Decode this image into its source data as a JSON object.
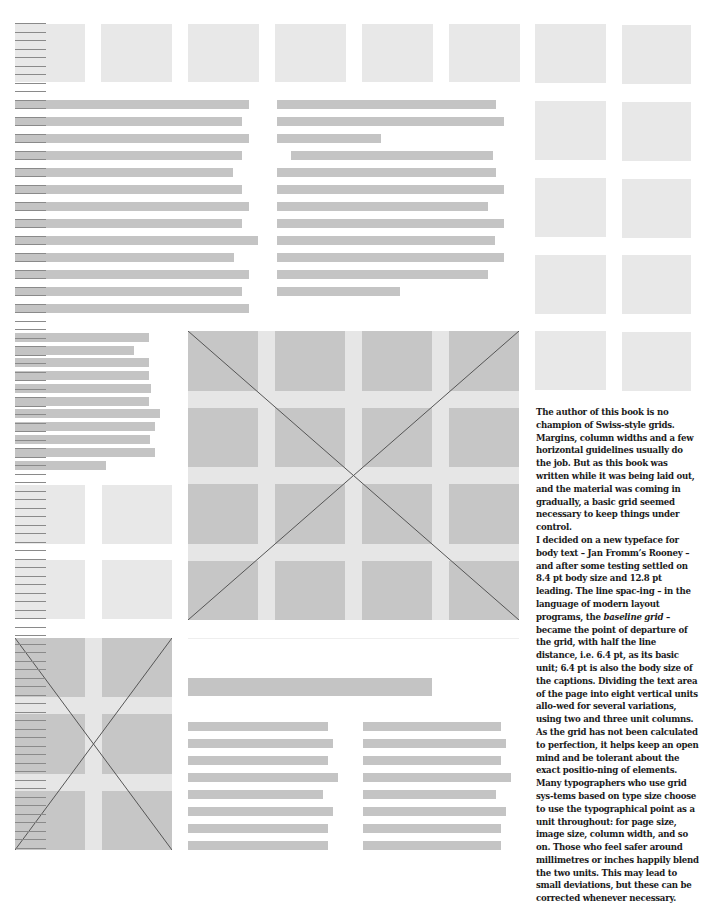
{
  "page": {
    "background": "#ffffff",
    "colors": {
      "placeholder_light": "#e8e8e8",
      "text_bar": "#c4c4c4",
      "image_cell": "#c6c6c6",
      "image_gutter": "#e6e6e6",
      "baseline_rule": "#8a8a8a",
      "cross_line": "#555555",
      "caption_text": "#1a1a1a"
    }
  },
  "baseline_ruler": {
    "x": 15,
    "width": 31,
    "start_y": 23,
    "step": 8.5,
    "end_y": 850
  },
  "top_row_squares": [
    {
      "x": 15,
      "y": 24,
      "w": 70,
      "h": 58
    },
    {
      "x": 101,
      "y": 24,
      "w": 71,
      "h": 58
    },
    {
      "x": 188,
      "y": 24,
      "w": 71,
      "h": 58
    },
    {
      "x": 275,
      "y": 24,
      "w": 71,
      "h": 58
    },
    {
      "x": 362,
      "y": 24,
      "w": 71,
      "h": 58
    },
    {
      "x": 449,
      "y": 24,
      "w": 71,
      "h": 58
    }
  ],
  "right_column_squares": [
    {
      "x": 535,
      "y": 24,
      "w": 71,
      "h": 59
    },
    {
      "x": 622,
      "y": 25,
      "w": 69,
      "h": 59
    },
    {
      "x": 535,
      "y": 101,
      "w": 71,
      "h": 59
    },
    {
      "x": 622,
      "y": 102,
      "w": 69,
      "h": 59
    },
    {
      "x": 535,
      "y": 178,
      "w": 71,
      "h": 59
    },
    {
      "x": 622,
      "y": 179,
      "w": 69,
      "h": 59
    },
    {
      "x": 535,
      "y": 255,
      "w": 71,
      "h": 59
    },
    {
      "x": 622,
      "y": 255,
      "w": 69,
      "h": 59
    },
    {
      "x": 535,
      "y": 331,
      "w": 71,
      "h": 59
    },
    {
      "x": 622,
      "y": 332,
      "w": 69,
      "h": 59
    }
  ],
  "text_block_left_top": {
    "x": 15,
    "lines": [
      {
        "y": 100,
        "w": 234
      },
      {
        "y": 117,
        "w": 227
      },
      {
        "y": 134,
        "w": 234
      },
      {
        "y": 151,
        "w": 227
      },
      {
        "y": 168,
        "w": 218
      },
      {
        "y": 185,
        "w": 227
      },
      {
        "y": 202,
        "w": 234
      },
      {
        "y": 219,
        "w": 227
      },
      {
        "y": 236,
        "w": 243
      },
      {
        "y": 253,
        "w": 219
      },
      {
        "y": 270,
        "w": 234
      },
      {
        "y": 287,
        "w": 227
      },
      {
        "y": 304,
        "w": 234
      }
    ]
  },
  "text_block_right_top": {
    "lines": [
      {
        "x": 277,
        "y": 100,
        "w": 219
      },
      {
        "x": 277,
        "y": 117,
        "w": 227
      },
      {
        "x": 277,
        "y": 134,
        "w": 104
      },
      {
        "x": 291,
        "y": 151,
        "w": 202
      },
      {
        "x": 277,
        "y": 168,
        "w": 219
      },
      {
        "x": 277,
        "y": 185,
        "w": 227
      },
      {
        "x": 277,
        "y": 202,
        "w": 211
      },
      {
        "x": 277,
        "y": 219,
        "w": 227
      },
      {
        "x": 277,
        "y": 236,
        "w": 218
      },
      {
        "x": 277,
        "y": 253,
        "w": 227
      },
      {
        "x": 277,
        "y": 270,
        "w": 211
      },
      {
        "x": 277,
        "y": 287,
        "w": 123
      }
    ]
  },
  "text_block_left_mid": {
    "x": 15,
    "lines": [
      {
        "y": 333,
        "w": 134
      },
      {
        "y": 346,
        "w": 119
      },
      {
        "y": 358,
        "w": 134
      },
      {
        "y": 371,
        "w": 134
      },
      {
        "y": 384,
        "w": 136
      },
      {
        "y": 397,
        "w": 134
      },
      {
        "y": 409,
        "w": 145
      },
      {
        "y": 422,
        "w": 140
      },
      {
        "y": 435,
        "w": 135
      },
      {
        "y": 448,
        "w": 140
      },
      {
        "y": 461,
        "w": 91
      }
    ]
  },
  "mid_left_squares": [
    {
      "x": 15,
      "y": 485,
      "w": 70,
      "h": 59
    },
    {
      "x": 102,
      "y": 485,
      "w": 70,
      "h": 59
    },
    {
      "x": 15,
      "y": 560,
      "w": 70,
      "h": 59
    },
    {
      "x": 102,
      "y": 560,
      "w": 70,
      "h": 59
    }
  ],
  "large_image_placeholder": {
    "x": 188,
    "y": 331,
    "w": 331,
    "h": 289,
    "cols": 4,
    "rows": 4,
    "gutter": 17,
    "crossed": true
  },
  "small_image_placeholder": {
    "x": 15,
    "y": 638,
    "w": 157,
    "h": 212,
    "cols": 2,
    "rows": 3,
    "gutter": 17,
    "crossed": true
  },
  "hairline_divider": {
    "x": 188,
    "y": 638,
    "w": 331
  },
  "bottom_heading_bar": {
    "x": 188,
    "y": 678,
    "w": 244,
    "h": 18
  },
  "bottom_text_columns": [
    {
      "x": 188,
      "lines": [
        {
          "y": 722,
          "w": 140
        },
        {
          "y": 739,
          "w": 145
        },
        {
          "y": 756,
          "w": 140
        },
        {
          "y": 773,
          "w": 150
        },
        {
          "y": 790,
          "w": 135
        },
        {
          "y": 807,
          "w": 145
        },
        {
          "y": 824,
          "w": 140
        },
        {
          "y": 841,
          "w": 140
        }
      ]
    },
    {
      "x": 363,
      "lines": [
        {
          "y": 722,
          "w": 138
        },
        {
          "y": 739,
          "w": 143
        },
        {
          "y": 756,
          "w": 138
        },
        {
          "y": 773,
          "w": 148
        },
        {
          "y": 790,
          "w": 133
        },
        {
          "y": 807,
          "w": 143
        },
        {
          "y": 824,
          "w": 138
        },
        {
          "y": 841,
          "w": 138
        }
      ]
    }
  ],
  "caption": {
    "paragraphs": [
      {
        "parts": [
          {
            "text": "The author of this book is no champion of Swiss-style grids. Margins, column widths and a few horizontal guidelines usually do the job. But as this book was written while it was being laid out, and the material was coming in gradually, a basic grid seemed necessary to keep things under control."
          }
        ]
      },
      {
        "parts": [
          {
            "text": "I decided on a new typeface for body text – Jan Fromm’s Rooney – and after some testing settled on 8.4 pt body size and 12.8 pt leading. The line spac-ing – in the language of modern layout programs, the "
          },
          {
            "text": "baseline grid",
            "italic": true
          },
          {
            "text": " – became the point of departure of the grid, with half the line distance, i.e. 6.4 pt, as its basic unit; 6.4 pt is also the body size of the captions. Dividing the text area of the page into eight vertical units allo-wed for several variations, using two and three unit columns."
          }
        ]
      },
      {
        "parts": [
          {
            "text": "As the grid has not been calculated to perfection, it helps keep an open mind and be tolerant about the exact positio-ning of elements."
          }
        ]
      },
      {
        "parts": [
          {
            "text": "Many typographers who use grid sys-tems based on type size choose to use the typographical point as a unit throughout: for page size, image size, column width, and so on. Those who feel safer around millimetres or inches happily blend the two units. This may lead to small deviations, but these can be corrected whenever necessary."
          }
        ]
      }
    ]
  }
}
